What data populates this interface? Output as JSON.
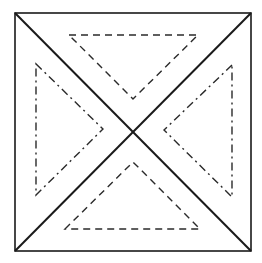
{
  "diagram": {
    "title": "",
    "colors": {
      "background": "#ffffff",
      "stroke": "#1a1a1a",
      "dashed_stroke": "#2a2a2a"
    },
    "outer_square": {
      "x1": 15,
      "y1": 13,
      "x2": 251,
      "y2": 251
    },
    "diagonals": [
      {
        "name": "diagonal-tl-br",
        "x1": 15,
        "y1": 13,
        "x2": 251,
        "y2": 251
      },
      {
        "name": "diagonal-tr-bl",
        "x1": 251,
        "y1": 13,
        "x2": 15,
        "y2": 251
      }
    ],
    "inner_triangles": [
      {
        "name": "top-triangle",
        "style": "dashed",
        "points": "69,35 198,35 133,99"
      },
      {
        "name": "left-triangle",
        "style": "dash-dot",
        "points": "36,64 103,129 36,195"
      },
      {
        "name": "right-triangle",
        "style": "dash-dot",
        "points": "232,65 164,130 232,197"
      },
      {
        "name": "bottom-triangle",
        "style": "dashed",
        "points": "65,229 133,162 200,229"
      }
    ]
  }
}
